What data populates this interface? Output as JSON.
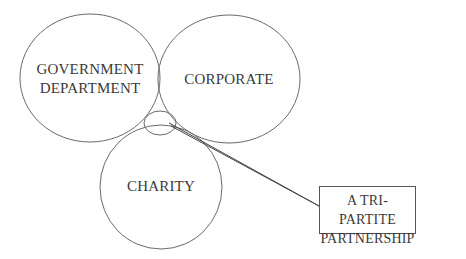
{
  "diagram": {
    "circles": [
      {
        "id": "government",
        "label_line1": "GOVERNMENT",
        "label_line2": "DEPARTMENT"
      },
      {
        "id": "corporate",
        "label": "CORPORATE"
      },
      {
        "id": "charity",
        "label": "CHARITY"
      }
    ],
    "intersection": {
      "label_line1": "A TRI-PARTITE",
      "label_line2": "PARTNERSHIP"
    },
    "colors": {
      "stroke": "#6a6a6a",
      "text": "#3a3a3a",
      "background": "#ffffff"
    }
  }
}
